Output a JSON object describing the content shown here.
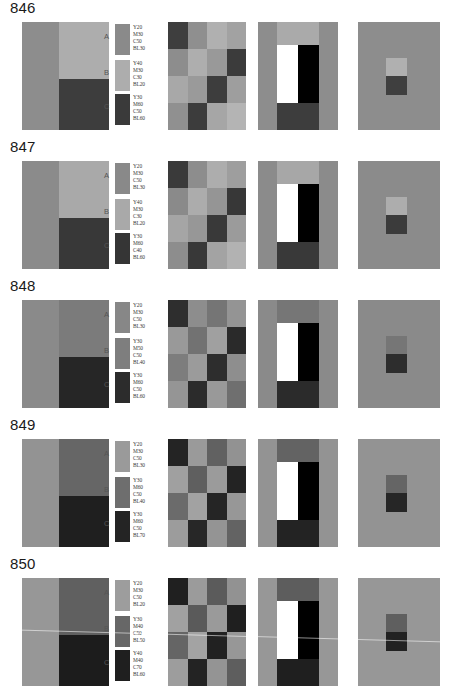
{
  "page": {
    "background": "#ffffff"
  },
  "legend_keys": [
    "A",
    "B",
    "C"
  ],
  "value_prefixes": [
    "Y",
    "M",
    "C",
    "BL"
  ],
  "scan_artifact": {
    "present_on_row": "850",
    "description": "faint diagonal white streak across plate"
  },
  "rows": [
    {
      "number": "846",
      "legend": [
        {
          "key": "A",
          "swatch": "#8a8a8a",
          "values": [
            "Y20",
            "M30",
            "C50",
            "BL30"
          ]
        },
        {
          "key": "B",
          "swatch": "#adadad",
          "values": [
            "Y40",
            "M30",
            "C30",
            "BL20"
          ]
        },
        {
          "key": "C",
          "swatch": "#3a3a3a",
          "values": [
            "Y30",
            "M60",
            "C50",
            "BL60"
          ]
        }
      ],
      "panel_split": {
        "left": "#8d8d8d",
        "top_right": "#adadad",
        "bottom_right": "#3d3d3d"
      },
      "panel_grid": [
        "#3e3e3e",
        "#8f8f8f",
        "#b0b0b0",
        "#a2a2a2",
        "#8d8d8d",
        "#aeaeae",
        "#999999",
        "#3b3b3b",
        "#a8a8a8",
        "#9a9a9a",
        "#3d3d3d",
        "#9e9e9e",
        "#909090",
        "#3c3c3c",
        "#a6a6a6",
        "#b4b4b4"
      ],
      "panel_bars": {
        "background": "#8d8d8d",
        "top_band": "#aaaaaa",
        "white_bar": "#ffffff",
        "black_bar": "#000000",
        "bottom_block": "#3d3d3d"
      },
      "panel_pair": {
        "background": "#8d8d8d",
        "upper": "#b0b0b0",
        "lower": "#3f3f3f"
      }
    },
    {
      "number": "847",
      "legend": [
        {
          "key": "A",
          "swatch": "#898989",
          "values": [
            "Y20",
            "M30",
            "C50",
            "BL30"
          ]
        },
        {
          "key": "B",
          "swatch": "#a9a9a9",
          "values": [
            "Y40",
            "M30",
            "C30",
            "BL20"
          ]
        },
        {
          "key": "C",
          "swatch": "#353535",
          "values": [
            "Y30",
            "M60",
            "C40",
            "BL60"
          ]
        }
      ],
      "panel_split": {
        "left": "#8b8b8b",
        "top_right": "#a9a9a9",
        "bottom_right": "#383838"
      },
      "panel_grid": [
        "#3a3a3a",
        "#8d8d8d",
        "#adadad",
        "#9e9e9e",
        "#8a8a8a",
        "#acacac",
        "#959595",
        "#373737",
        "#a5a5a5",
        "#979797",
        "#393939",
        "#9b9b9b",
        "#8d8d8d",
        "#383838",
        "#a3a3a3",
        "#b2b2b2"
      ],
      "panel_bars": {
        "background": "#8b8b8b",
        "top_band": "#a7a7a7",
        "white_bar": "#ffffff",
        "black_bar": "#000000",
        "bottom_block": "#393939"
      },
      "panel_pair": {
        "background": "#8b8b8b",
        "upper": "#adadad",
        "lower": "#3b3b3b"
      }
    },
    {
      "number": "848",
      "legend": [
        {
          "key": "A",
          "swatch": "#878787",
          "values": [
            "Y20",
            "M30",
            "C50",
            "BL30"
          ]
        },
        {
          "key": "B",
          "swatch": "#7e7e7e",
          "values": [
            "Y30",
            "M50",
            "C50",
            "BL40"
          ]
        },
        {
          "key": "C",
          "swatch": "#2c2c2c",
          "values": [
            "Y30",
            "M60",
            "C50",
            "BL60"
          ]
        }
      ],
      "panel_split": {
        "left": "#8a8a8a",
        "top_right": "#7b7b7b",
        "bottom_right": "#262626"
      },
      "panel_grid": [
        "#2e2e2e",
        "#8d8d8d",
        "#757575",
        "#949494",
        "#999999",
        "#727272",
        "#a0a0a0",
        "#2a2a2a",
        "#7d7d7d",
        "#9b9b9b",
        "#2d2d2d",
        "#8e8e8e",
        "#959595",
        "#2b2b2b",
        "#999999",
        "#6f6f6f"
      ],
      "panel_bars": {
        "background": "#8a8a8a",
        "top_band": "#767676",
        "white_bar": "#ffffff",
        "black_bar": "#000000",
        "bottom_block": "#2b2b2b"
      },
      "panel_pair": {
        "background": "#8a8a8a",
        "upper": "#767676",
        "lower": "#2d2d2d"
      }
    },
    {
      "number": "849",
      "legend": [
        {
          "key": "A",
          "swatch": "#9a9a9a",
          "values": [
            "Y20",
            "M30",
            "C50",
            "BL30"
          ]
        },
        {
          "key": "B",
          "swatch": "#6e6e6e",
          "values": [
            "Y30",
            "M60",
            "C50",
            "BL40"
          ]
        },
        {
          "key": "C",
          "swatch": "#242424",
          "values": [
            "Y30",
            "M60",
            "C50",
            "BL70"
          ]
        }
      ],
      "panel_split": {
        "left": "#939393",
        "top_right": "#666666",
        "bottom_right": "#1f1f1f"
      },
      "panel_grid": [
        "#242424",
        "#9a9a9a",
        "#616161",
        "#929292",
        "#a0a0a0",
        "#5f5f5f",
        "#9b9b9b",
        "#232323",
        "#6b6b6b",
        "#a2a2a2",
        "#252525",
        "#979797",
        "#9c9c9c",
        "#272727",
        "#949494",
        "#636363"
      ],
      "panel_bars": {
        "background": "#939393",
        "top_band": "#636363",
        "white_bar": "#ffffff",
        "black_bar": "#000000",
        "bottom_block": "#232323"
      },
      "panel_pair": {
        "background": "#939393",
        "upper": "#656565",
        "lower": "#262626"
      }
    },
    {
      "number": "850",
      "legend": [
        {
          "key": "A",
          "swatch": "#9d9d9d",
          "values": [
            "Y20",
            "M30",
            "C50",
            "BL20"
          ]
        },
        {
          "key": "B",
          "swatch": "#676767",
          "values": [
            "Y30",
            "M40",
            "C50",
            "BL50"
          ]
        },
        {
          "key": "C",
          "swatch": "#1f1f1f",
          "values": [
            "Y40",
            "M40",
            "C70",
            "BL60"
          ]
        }
      ],
      "panel_split": {
        "left": "#979797",
        "top_right": "#606060",
        "bottom_right": "#1c1c1c"
      },
      "panel_grid": [
        "#202020",
        "#9b9b9b",
        "#5b5b5b",
        "#929292",
        "#a1a1a1",
        "#5a5a5a",
        "#9a9a9a",
        "#1f1f1f",
        "#656565",
        "#a3a3a3",
        "#212121",
        "#979797",
        "#9d9d9d",
        "#232323",
        "#949494",
        "#5e5e5e"
      ],
      "panel_bars": {
        "background": "#979797",
        "top_band": "#5d5d5d",
        "white_bar": "#ffffff",
        "black_bar": "#000000",
        "bottom_block": "#1f1f1f"
      },
      "panel_pair": {
        "background": "#979797",
        "upper": "#5f5f5f",
        "lower": "#222222"
      }
    }
  ]
}
